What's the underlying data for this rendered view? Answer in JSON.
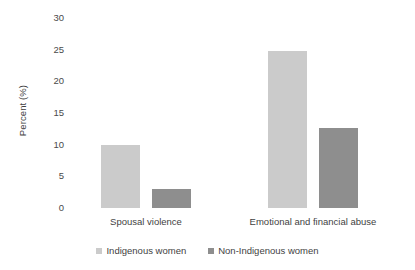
{
  "chart_data": {
    "type": "bar",
    "title": "",
    "xlabel": "",
    "ylabel": "Percent (%)",
    "categories": [
      "Spousal violence",
      "Emotional and financial abuse"
    ],
    "series": [
      {
        "name": "Indigenous women",
        "color": "#cbcbcb",
        "values": [
          9.9,
          24.8
        ]
      },
      {
        "name": "Non-Indigenous women",
        "color": "#8e8e8e",
        "values": [
          3.0,
          12.7
        ]
      }
    ],
    "ylim": [
      0,
      30
    ],
    "yticks": [
      0,
      5,
      10,
      15,
      20,
      25,
      30
    ],
    "ytick_labels": [
      "0",
      "5",
      "10",
      "15",
      "20",
      "25",
      "30"
    ],
    "grid": false,
    "legend_position": "bottom",
    "legend_entries": [
      "Indigenous women",
      "Non-Indigenous women"
    ]
  }
}
